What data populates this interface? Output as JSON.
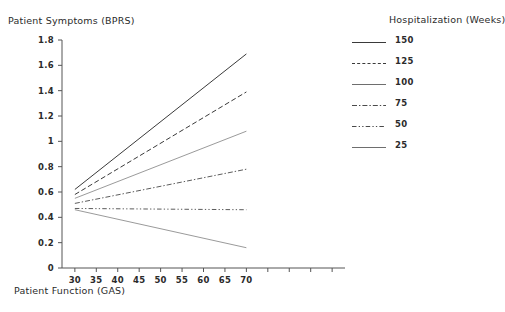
{
  "chart_data": {
    "type": "line",
    "title": "",
    "xlabel": "Patient Function (GAS)",
    "ylabel": "Patient Symptoms (BPRS)",
    "legend_title": "Hospitalization (Weeks)",
    "legend_position": "right",
    "grid": false,
    "xlim": [
      27,
      93
    ],
    "ylim": [
      0,
      1.8
    ],
    "x": [
      30,
      70
    ],
    "xticks": [
      30,
      35,
      40,
      45,
      50,
      55,
      60,
      65,
      70
    ],
    "xtick_labels": [
      "30",
      "35",
      "40",
      "45",
      "50",
      "55",
      "60",
      "65",
      "70"
    ],
    "yticks": [
      0,
      0.2,
      0.4,
      0.6,
      0.8,
      1,
      1.2,
      1.4,
      1.6,
      1.8
    ],
    "ytick_labels": [
      "0",
      "0.2",
      "0.4",
      "0.6",
      "0.8",
      "1",
      "1.2",
      "1.4",
      "1.6",
      "1.8"
    ],
    "series": [
      {
        "name": "150",
        "values": [
          0.62,
          1.69
        ],
        "dash": "solid",
        "width": 1.0,
        "color": "#3a3a3a"
      },
      {
        "name": "125",
        "values": [
          0.58,
          1.39
        ],
        "dash": "dashed",
        "width": 1.0,
        "color": "#3a3a3a"
      },
      {
        "name": "100",
        "values": [
          0.55,
          1.08
        ],
        "dash": "solid",
        "width": 0.7,
        "color": "#6e6e6e"
      },
      {
        "name": "75",
        "values": [
          0.51,
          0.78
        ],
        "dash": "dashdot",
        "width": 0.9,
        "color": "#4a4a4a"
      },
      {
        "name": "50",
        "values": [
          0.47,
          0.46
        ],
        "dash": "dashdotdot",
        "width": 0.9,
        "color": "#4a4a4a"
      },
      {
        "name": "25",
        "values": [
          0.46,
          0.16
        ],
        "dash": "solid",
        "width": 0.7,
        "color": "#6e6e6e"
      }
    ]
  },
  "axes": {
    "y_title": "Patient Symptoms (BPRS)",
    "x_title": "Patient Function (GAS)"
  },
  "legend": {
    "title": "Hospitalization (Weeks)",
    "items": [
      {
        "label": "150"
      },
      {
        "label": "125"
      },
      {
        "label": "100"
      },
      {
        "label": "75"
      },
      {
        "label": "50"
      },
      {
        "label": "25"
      }
    ]
  }
}
